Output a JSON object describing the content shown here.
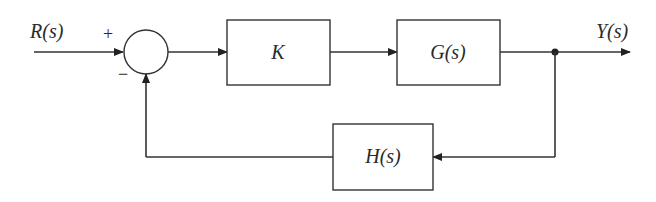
{
  "diagram": {
    "type": "feedback-control-block-diagram",
    "input": {
      "label": "R(s)"
    },
    "output": {
      "label": "Y(s)"
    },
    "summing_junction": {
      "plus_sign": "+",
      "minus_sign": "−"
    },
    "blocks": [
      {
        "id": "controller",
        "label": "K"
      },
      {
        "id": "plant",
        "label": "G(s)"
      },
      {
        "id": "feedback",
        "label": "H(s)"
      }
    ],
    "connections": [
      {
        "from": "R(s)",
        "to": "summing_junction",
        "sign": "+"
      },
      {
        "from": "summing_junction",
        "to": "controller"
      },
      {
        "from": "controller",
        "to": "plant"
      },
      {
        "from": "plant",
        "to": "Y(s)"
      },
      {
        "from": "Y(s)",
        "to": "feedback"
      },
      {
        "from": "feedback",
        "to": "summing_junction",
        "sign": "−"
      }
    ]
  }
}
